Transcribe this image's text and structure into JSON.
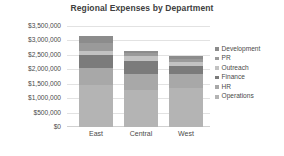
{
  "chart_data": {
    "type": "bar",
    "subtype": "stacked-column",
    "title": "Regional Expenses by Department",
    "subtitle": "",
    "xlabel": "",
    "ylabel": "",
    "categories": [
      "East",
      "Central",
      "West"
    ],
    "series": [
      {
        "name": "Operations",
        "values": [
          1450000,
          1300000,
          1350000
        ],
        "color": "#b4b4b4"
      },
      {
        "name": "HR",
        "values": [
          600000,
          550000,
          500000
        ],
        "color": "#a8a8a8"
      },
      {
        "name": "Finance",
        "values": [
          450000,
          450000,
          250000
        ],
        "color": "#7b7b7b"
      },
      {
        "name": "Outreach",
        "values": [
          150000,
          150000,
          150000
        ],
        "color": "#c2c2c2"
      },
      {
        "name": "PR",
        "values": [
          250000,
          100000,
          100000
        ],
        "color": "#9a9a9a"
      },
      {
        "name": "Development",
        "values": [
          250000,
          100000,
          100000
        ],
        "color": "#8c8c8c"
      }
    ],
    "totals": [
      3150000,
      2650000,
      2450000
    ],
    "ylim": [
      0,
      3500000
    ],
    "ytick_step": 500000,
    "ytick_labels": [
      "$3,500,000",
      "$3,000,000",
      "$2,500,000",
      "$2,000,000",
      "$1,500,000",
      "$1,000,000",
      "$500,000",
      "$0"
    ],
    "ytick_values": [
      3500000,
      3000000,
      2500000,
      2000000,
      1500000,
      1000000,
      500000,
      0
    ],
    "grid": true,
    "legend_position": "right",
    "legend_entries": [
      "Development",
      "PR",
      "Outreach",
      "Finance",
      "HR",
      "Operations"
    ],
    "background_color": "#ffffff",
    "text_color": "#4a4a4a"
  }
}
